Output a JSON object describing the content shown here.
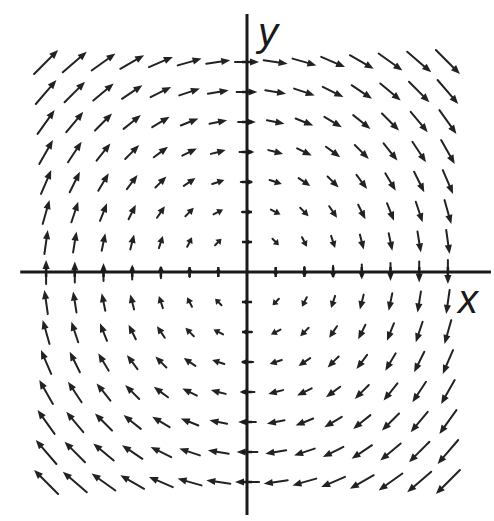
{
  "chart_data": {
    "type": "scatter",
    "subtype": "vector-field",
    "title": "",
    "xlabel": "x",
    "ylabel": "y",
    "field": {
      "u": "y",
      "v": "-x",
      "description": "Rotational (clockwise) vector field F(x, y) = <y, -x>"
    },
    "grid": {
      "x": [
        -7,
        -6,
        -5,
        -4,
        -3,
        -2,
        -1,
        0,
        1,
        2,
        3,
        4,
        5,
        6,
        7
      ],
      "y": [
        -7,
        -6,
        -5,
        -4,
        -3,
        -2,
        -1,
        0,
        1,
        2,
        3,
        4,
        5,
        6,
        7
      ]
    },
    "xlim": [
      -7.9,
      8.5
    ],
    "ylim": [
      -8.1,
      8.6
    ],
    "grid_lines": false,
    "legend": "none",
    "tick_labels": false,
    "colors": {
      "axes": "#1a1a1a",
      "arrows": "#222222",
      "background": "#ffffff"
    }
  }
}
